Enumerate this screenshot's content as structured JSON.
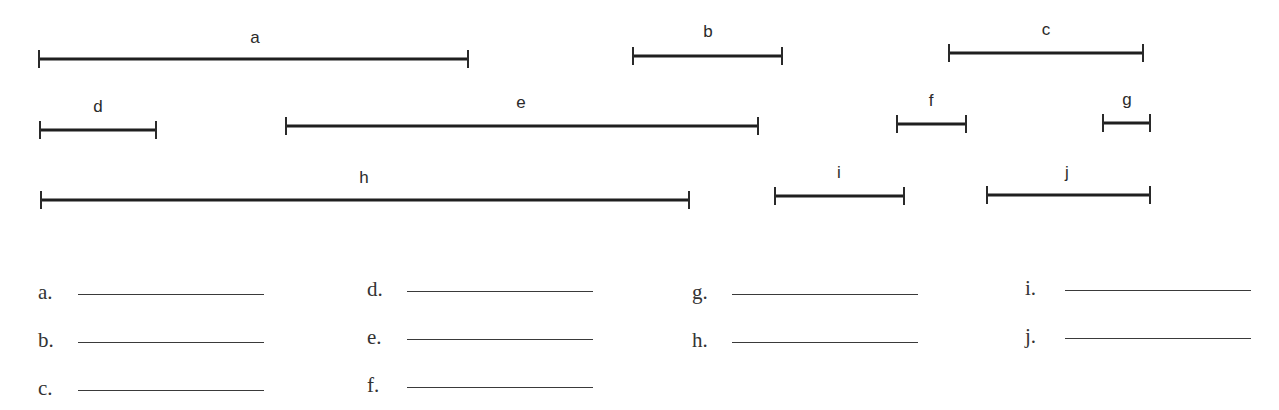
{
  "worksheet": {
    "segments": [
      {
        "label": "a",
        "x1": 39,
        "x2": 468,
        "y": 59,
        "label_x": 255,
        "label_y": 43
      },
      {
        "label": "b",
        "x1": 633,
        "x2": 782,
        "y": 56,
        "label_x": 708,
        "label_y": 37
      },
      {
        "label": "c",
        "x1": 949,
        "x2": 1143,
        "y": 53,
        "label_x": 1046,
        "label_y": 35
      },
      {
        "label": "d",
        "x1": 40,
        "x2": 156,
        "y": 130,
        "label_x": 98,
        "label_y": 112
      },
      {
        "label": "e",
        "x1": 286,
        "x2": 758,
        "y": 126,
        "label_x": 521,
        "label_y": 108
      },
      {
        "label": "f",
        "x1": 897,
        "x2": 966,
        "y": 124,
        "label_x": 931,
        "label_y": 106
      },
      {
        "label": "g",
        "x1": 1103,
        "x2": 1150,
        "y": 123,
        "label_x": 1127,
        "label_y": 105
      },
      {
        "label": "h",
        "x1": 41,
        "x2": 689,
        "y": 200,
        "label_x": 364,
        "label_y": 183
      },
      {
        "label": "i",
        "x1": 775,
        "x2": 904,
        "y": 196,
        "label_x": 839,
        "label_y": 178
      },
      {
        "label": "j",
        "x1": 987,
        "x2": 1150,
        "y": 195,
        "label_x": 1067,
        "label_y": 178
      }
    ],
    "answers": [
      {
        "label": "a.",
        "value": "",
        "x": 38,
        "y": 280
      },
      {
        "label": "b.",
        "value": "",
        "x": 38,
        "y": 328
      },
      {
        "label": "c.",
        "value": "",
        "x": 38,
        "y": 376
      },
      {
        "label": "d.",
        "value": "",
        "x": 367,
        "y": 277
      },
      {
        "label": "e.",
        "value": "",
        "x": 367,
        "y": 325
      },
      {
        "label": "f.",
        "value": "",
        "x": 367,
        "y": 373
      },
      {
        "label": "g.",
        "value": "",
        "x": 692,
        "y": 280
      },
      {
        "label": "h.",
        "value": "",
        "x": 692,
        "y": 328
      },
      {
        "label": "i.",
        "value": "",
        "x": 1025,
        "y": 276
      },
      {
        "label": "j.",
        "value": "",
        "x": 1025,
        "y": 324
      }
    ],
    "colors": {
      "ink": "#1f1f1f",
      "background": "#ffffff"
    }
  }
}
